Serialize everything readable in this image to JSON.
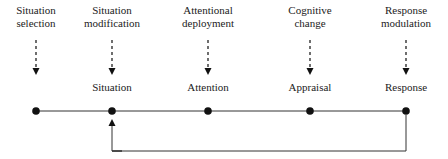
{
  "diagram": {
    "type": "process-model",
    "strategies": [
      {
        "line1": "Situation",
        "line2": "selection",
        "x": 36
      },
      {
        "line1": "Situation",
        "line2": "modification",
        "x": 112
      },
      {
        "line1": "Attentional",
        "line2": "deployment",
        "x": 208
      },
      {
        "line1": "Cognitive",
        "line2": "change",
        "x": 310
      },
      {
        "line1": "Response",
        "line2": "modulation",
        "x": 406
      }
    ],
    "stages": [
      {
        "label": "Situation",
        "x": 112
      },
      {
        "label": "Attention",
        "x": 208
      },
      {
        "label": "Appraisal",
        "x": 310
      },
      {
        "label": "Response",
        "x": 406
      }
    ],
    "feedback": {
      "from": "Response",
      "to": "Situation"
    }
  }
}
